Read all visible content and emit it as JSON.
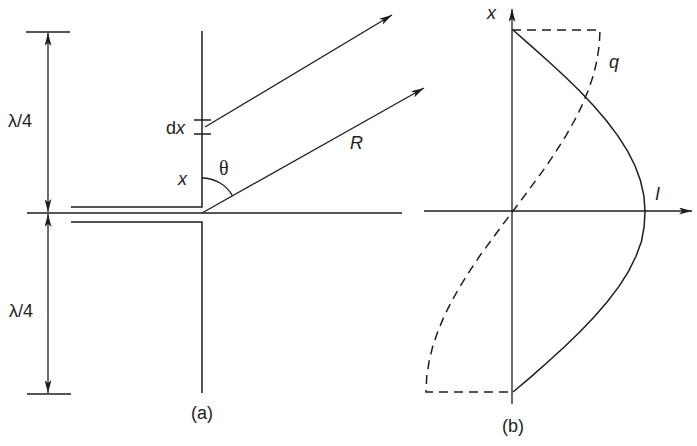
{
  "figure": {
    "panel_a": {
      "caption": "(a)",
      "dimension_upper_label": "λ/4",
      "dimension_lower_label": "λ/4",
      "element_label_d": "d",
      "element_label_x": "x",
      "position_label": "x",
      "angle_label": "θ",
      "distance_label": "R"
    },
    "panel_b": {
      "caption": "(b)",
      "vertical_axis_label": "x",
      "horizontal_axis_label": "I",
      "charge_curve_label": "q",
      "current_curve_style": "solid",
      "charge_curve_style": "dashed"
    }
  },
  "colors": {
    "stroke": "#1e1e1e",
    "background": "#ffffff"
  }
}
